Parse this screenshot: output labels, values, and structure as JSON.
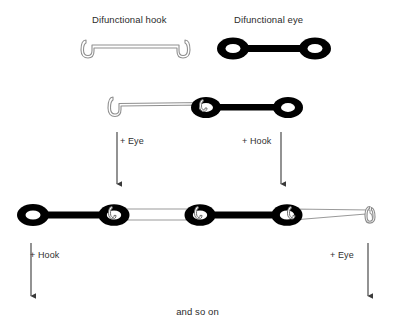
{
  "diagram": {
    "title_hook": "Difunctional hook",
    "title_eye": "Difunctional eye",
    "footer": "and so on",
    "arrows": [
      {
        "id": "arrow-add-eye-top",
        "label": "+ Eye"
      },
      {
        "id": "arrow-add-hook-top",
        "label": "+ Hook"
      },
      {
        "id": "arrow-add-hook-bottom",
        "label": "+ Hook"
      },
      {
        "id": "arrow-add-eye-bottom",
        "label": "+ Eye"
      }
    ],
    "colors": {
      "background": "#ffffff",
      "text": "#2b2b2b",
      "eye_fill": "#000000",
      "hook_stroke": "#8a8a8a",
      "hook_fill": "#ffffff",
      "arrow": "#3a3a3a"
    },
    "rows": [
      {
        "id": "monomer-row",
        "items": [
          {
            "id": "difunctional-hook-monomer",
            "type": "hook",
            "label": "Difunctional hook"
          },
          {
            "id": "difunctional-eye-monomer",
            "type": "eye",
            "label": "Difunctional eye"
          }
        ]
      },
      {
        "id": "dimer-row",
        "items": [
          {
            "id": "dimer-hook-unit",
            "type": "hook"
          },
          {
            "id": "dimer-eye-unit",
            "type": "eye"
          }
        ]
      },
      {
        "id": "oligomer-row",
        "items": [
          {
            "id": "oligomer-eye-unit-1",
            "type": "eye"
          },
          {
            "id": "oligomer-hook-unit-1",
            "type": "hook"
          },
          {
            "id": "oligomer-eye-unit-2",
            "type": "eye"
          },
          {
            "id": "oligomer-hook-unit-2",
            "type": "hook"
          }
        ]
      }
    ]
  }
}
